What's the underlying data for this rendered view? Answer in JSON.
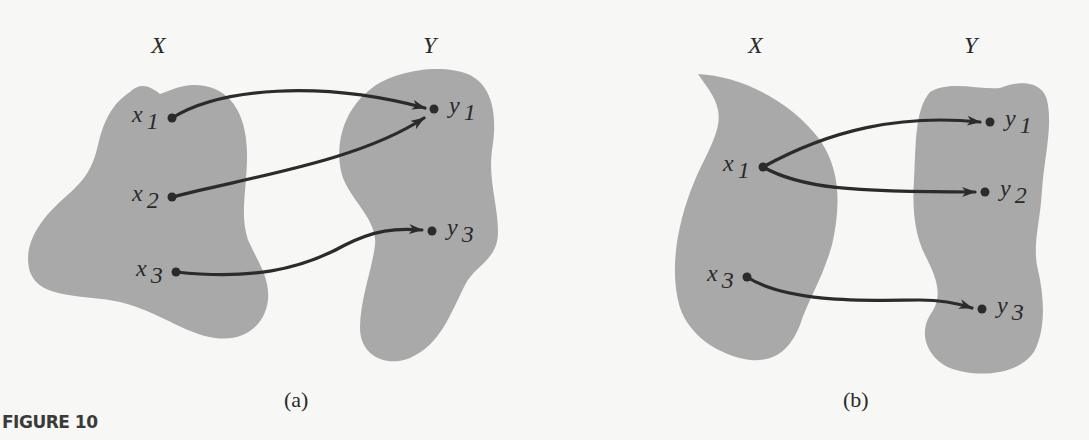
{
  "figure": {
    "label": "FIGURE 10",
    "colors": {
      "blob_fill": "#a9a9a9",
      "arrow": "#2b2b2b",
      "background": "#f7f7f5"
    }
  },
  "panels": [
    {
      "id": "a",
      "caption": "(a)",
      "domain_set": "X",
      "codomain_set": "Y",
      "domain_points": [
        {
          "name": "x",
          "sub": "1"
        },
        {
          "name": "x",
          "sub": "2"
        },
        {
          "name": "x",
          "sub": "3"
        }
      ],
      "codomain_points": [
        {
          "name": "y",
          "sub": "1"
        },
        {
          "name": "y",
          "sub": "3"
        }
      ],
      "mappings": [
        {
          "from": "x1",
          "to": "y1"
        },
        {
          "from": "x2",
          "to": "y1"
        },
        {
          "from": "x3",
          "to": "y3"
        }
      ]
    },
    {
      "id": "b",
      "caption": "(b)",
      "domain_set": "X",
      "codomain_set": "Y",
      "domain_points": [
        {
          "name": "x",
          "sub": "1"
        },
        {
          "name": "x",
          "sub": "3"
        }
      ],
      "codomain_points": [
        {
          "name": "y",
          "sub": "1"
        },
        {
          "name": "y",
          "sub": "2"
        },
        {
          "name": "y",
          "sub": "3"
        }
      ],
      "mappings": [
        {
          "from": "x1",
          "to": "y1"
        },
        {
          "from": "x1",
          "to": "y2"
        },
        {
          "from": "x3",
          "to": "y3"
        }
      ]
    }
  ]
}
